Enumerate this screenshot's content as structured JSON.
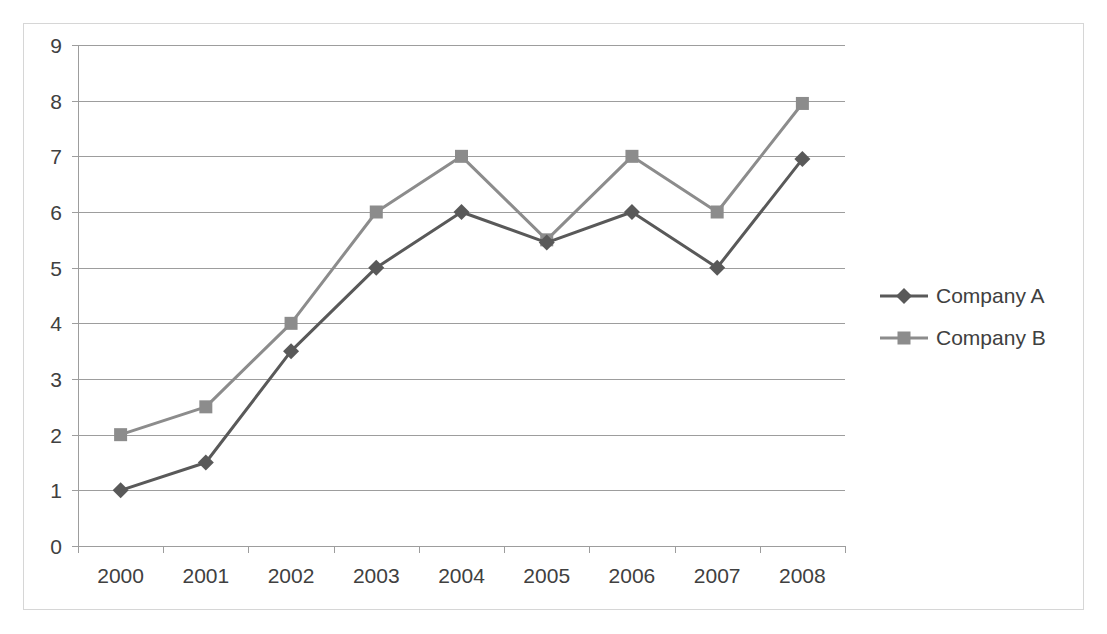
{
  "chart_data": {
    "type": "line",
    "title": "",
    "subtitle": "",
    "xlabel": "",
    "ylabel": "",
    "categories": [
      "2000",
      "2001",
      "2002",
      "2003",
      "2004",
      "2005",
      "2006",
      "2007",
      "2008"
    ],
    "series": [
      {
        "name": "Company A",
        "color": "#595959",
        "marker": "diamond",
        "values": [
          1,
          1.5,
          3.5,
          5,
          6,
          5.45,
          6,
          5,
          6.95
        ]
      },
      {
        "name": "Company B",
        "color": "#8c8c8c",
        "marker": "square",
        "values": [
          2,
          2.5,
          4,
          6,
          7,
          5.5,
          7,
          6,
          7.95
        ]
      }
    ],
    "ylim": [
      0,
      9
    ],
    "ytick_labels": [
      "0",
      "1",
      "2",
      "3",
      "4",
      "5",
      "6",
      "7",
      "8",
      "9"
    ],
    "ytick_values": [
      0,
      1,
      2,
      3,
      4,
      5,
      6,
      7,
      8,
      9
    ],
    "grid": true,
    "grid_color": "#9d9d9d",
    "legend_position": "right",
    "plot_background": "#ffffff",
    "border_color": "#d6d6d6",
    "text_color": "#404040"
  },
  "legend": {
    "items": [
      {
        "label": "Company A"
      },
      {
        "label": "Company B"
      }
    ]
  },
  "axes": {
    "y": {
      "labels": [
        "9",
        "8",
        "7",
        "6",
        "5",
        "4",
        "3",
        "2",
        "1",
        "0"
      ]
    },
    "x": {
      "labels": [
        "2000",
        "2001",
        "2002",
        "2003",
        "2004",
        "2005",
        "2006",
        "2007",
        "2008"
      ]
    }
  }
}
